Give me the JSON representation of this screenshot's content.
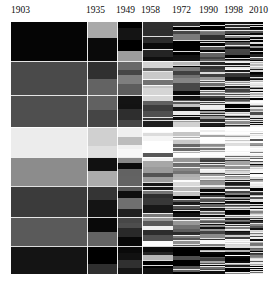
{
  "chart_data": {
    "type": "area",
    "title": "",
    "subtitle": "",
    "xlabel": "",
    "ylabel": "",
    "grid": false,
    "legend": "none",
    "orientation": "horizontal",
    "xlim": [
      1903,
      2010
    ],
    "ylim": [
      0,
      100
    ],
    "axis_side": "top",
    "tick_labels": [
      "1903",
      "1935",
      "1949",
      "1958",
      "1972",
      "1990",
      "1998",
      "2010"
    ],
    "tick_values": [
      1903,
      1935,
      1949,
      1958,
      1972,
      1990,
      1998,
      2010
    ],
    "tick_x_px": [
      11,
      86,
      116,
      141,
      172,
      199,
      224,
      249
    ],
    "era_boundaries_px": [
      0,
      76,
      106,
      131,
      162,
      189,
      214,
      239,
      252
    ],
    "plot_rect_px": {
      "left": 11,
      "top": 22,
      "width": 252,
      "height": 252
    },
    "palette": {
      "near-black": "#050505",
      "very-dark-grey": "#1d1d1d",
      "dark-grey": "#3a3a3a",
      "mid-dark-grey": "#4f4f4f",
      "mid-grey": "#6e6e6e",
      "grey": "#8a8a8a",
      "light-grey": "#a8a8a8",
      "lighter-grey": "#c4c4c4",
      "pale-grey": "#dcdcdc",
      "near-white": "#f0f0f0",
      "white": "#fbfbfb",
      "background": "#ffffff"
    },
    "root_bands": [
      {
        "name": "band-1",
        "y0": 0,
        "y1": 15.6,
        "color": "#050505"
      },
      {
        "name": "band-2",
        "y0": 15.6,
        "y1": 28.8,
        "color": "#4a4a4a"
      },
      {
        "name": "band-3",
        "y0": 28.8,
        "y1": 41.8,
        "color": "#4f4f4f"
      },
      {
        "name": "band-4",
        "y0": 41.8,
        "y1": 53.6,
        "color": "#ececec"
      },
      {
        "name": "band-5",
        "y0": 53.6,
        "y1": 65.2,
        "color": "#8c8c8c"
      },
      {
        "name": "band-6",
        "y0": 65.2,
        "y1": 77.4,
        "color": "#3b3b3b"
      },
      {
        "name": "band-7",
        "y0": 77.4,
        "y1": 89.0,
        "color": "#5a5a5a"
      },
      {
        "name": "band-8",
        "y0": 89.0,
        "y1": 100,
        "color": "#141414"
      }
    ],
    "eras": [
      {
        "label": "1903",
        "x0": 0,
        "x1": 76,
        "splits": 1
      },
      {
        "label": "1935",
        "x0": 76,
        "x1": 106,
        "splits": 2
      },
      {
        "label": "1949",
        "x0": 106,
        "x1": 131,
        "splits": 4
      },
      {
        "label": "1958",
        "x0": 131,
        "x1": 162,
        "splits": 6
      },
      {
        "label": "1972",
        "x0": 162,
        "x1": 189,
        "splits": 9
      },
      {
        "label": "1990",
        "x0": 189,
        "x1": 214,
        "splits": 12
      },
      {
        "label": "1998",
        "x0": 214,
        "x1": 239,
        "splits": 16
      },
      {
        "label": "2010",
        "x0": 239,
        "x1": 252,
        "splits": 20
      }
    ],
    "series": [
      {
        "name": "band-1",
        "values": [
          15.6,
          11.0,
          9.4,
          8.2,
          7.4,
          6.8,
          6.3,
          6.0
        ]
      },
      {
        "name": "band-2",
        "values": [
          13.2,
          12.4,
          11.6,
          10.8,
          10.1,
          9.6,
          9.2,
          8.9
        ]
      },
      {
        "name": "band-3",
        "values": [
          13.0,
          13.6,
          13.2,
          12.6,
          12.0,
          11.5,
          11.1,
          10.8
        ]
      },
      {
        "name": "band-4",
        "values": [
          11.8,
          12.2,
          12.6,
          12.9,
          13.1,
          13.2,
          13.3,
          13.4
        ]
      },
      {
        "name": "band-5",
        "values": [
          11.6,
          12.0,
          12.4,
          12.8,
          13.2,
          13.5,
          13.7,
          13.9
        ]
      },
      {
        "name": "band-6",
        "values": [
          12.2,
          12.6,
          13.0,
          13.3,
          13.6,
          13.8,
          14.0,
          14.2
        ]
      },
      {
        "name": "band-7",
        "values": [
          11.6,
          12.6,
          13.4,
          14.0,
          14.4,
          14.8,
          15.1,
          15.3
        ]
      },
      {
        "name": "band-8",
        "values": [
          11.0,
          13.6,
          14.4,
          15.4,
          16.2,
          16.8,
          17.3,
          17.5
        ]
      }
    ]
  },
  "axis": {
    "labels": [
      {
        "text": "1903",
        "x": 11
      },
      {
        "text": "1935",
        "x": 86
      },
      {
        "text": "1949",
        "x": 116
      },
      {
        "text": "1958",
        "x": 141
      },
      {
        "text": "1972",
        "x": 172
      },
      {
        "text": "1990",
        "x": 199
      },
      {
        "text": "1998",
        "x": 224
      },
      {
        "text": "2010",
        "x": 249
      }
    ]
  }
}
